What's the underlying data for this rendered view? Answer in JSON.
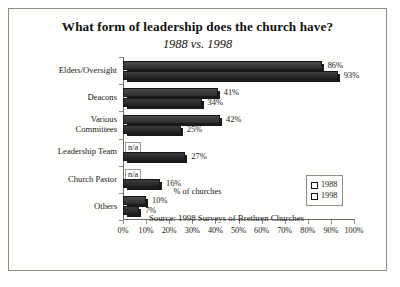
{
  "chart_data": {
    "type": "bar",
    "orientation": "horizontal",
    "title": "What form of leadership does the church have?",
    "subtitle": "1988 vs. 1998",
    "xlabel": "% of churches",
    "ylabel": "",
    "xlim": [
      0,
      100
    ],
    "grid": false,
    "legend_position": "inside-right",
    "source": "Source: 1998 Surveys of Brethren Churches",
    "categories": [
      "Elders/Oversight",
      "Deacons",
      "Various Committees",
      "Leadership Team",
      "Church Pastor",
      "Others"
    ],
    "category_lines": [
      [
        "Elders/Oversight"
      ],
      [
        "Deacons"
      ],
      [
        "Various",
        "Committees"
      ],
      [
        "Leadership Team"
      ],
      [
        "Church Pastor"
      ],
      [
        "Others"
      ]
    ],
    "series": [
      {
        "name": "1988",
        "color": "#3d3d3d",
        "values": [
          86,
          41,
          42,
          null,
          null,
          10
        ],
        "labels": [
          "86%",
          "41%",
          "42%",
          "n/a",
          "n/a",
          "10%"
        ]
      },
      {
        "name": "1998",
        "color": "#2a2a2a",
        "values": [
          93,
          34,
          25,
          27,
          16,
          7
        ],
        "labels": [
          "93%",
          "34%",
          "25%",
          "27%",
          "16%",
          "7%"
        ]
      }
    ],
    "xticks": [
      "0%",
      "10%",
      "20%",
      "30%",
      "40%",
      "50%",
      "60%",
      "70%",
      "80%",
      "90%",
      "100%"
    ],
    "xtick_values": [
      0,
      10,
      20,
      30,
      40,
      50,
      60,
      70,
      80,
      90,
      100
    ]
  }
}
